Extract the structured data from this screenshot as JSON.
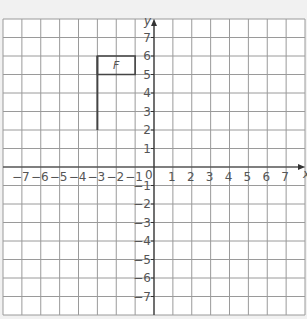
{
  "diagram": {
    "type": "coordinate-grid",
    "x_axis": {
      "label": "x",
      "min": -8,
      "max": 8,
      "tick_labels": [
        "-7",
        "-6",
        "-5",
        "-4",
        "-3",
        "-2",
        "-1",
        "1",
        "2",
        "3",
        "4",
        "5",
        "6",
        "7"
      ]
    },
    "y_axis": {
      "label": "y",
      "min": -8,
      "max": 8,
      "tick_labels": [
        "7",
        "6",
        "5",
        "4",
        "3",
        "2",
        "1",
        "-1",
        "-2",
        "-3",
        "-4",
        "-5",
        "-6",
        "-7"
      ]
    },
    "origin_label": "0",
    "shape": {
      "label": "F",
      "description": "Flag shape: vertical pole from (-3,2) to (-3,6) with rectangular flag from (-3,5) to (-1,6)",
      "pole": [
        [
          -3,
          2
        ],
        [
          -3,
          6
        ]
      ],
      "flag_rect": [
        [
          -3,
          5
        ],
        [
          -1,
          5
        ],
        [
          -1,
          6
        ],
        [
          -3,
          6
        ]
      ]
    },
    "colors": {
      "grid": "#9a9a9a",
      "axis": "#333333",
      "shape": "#444444",
      "background": "#ffffff"
    }
  }
}
